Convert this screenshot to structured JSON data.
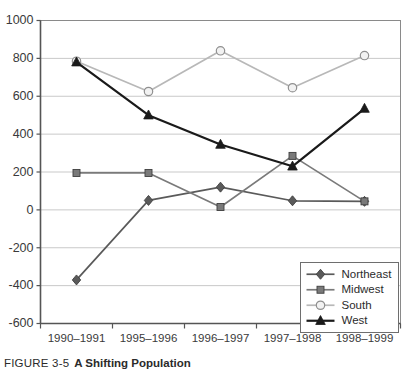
{
  "figure": {
    "caption_number": "FIGURE 3-5",
    "caption_title": "A Shifting Population"
  },
  "chart_data": {
    "type": "line",
    "title": "A Shifting Population",
    "xlabel": "",
    "ylabel": "",
    "categories": [
      "1990–1991",
      "1995–1996",
      "1996–1997",
      "1997–1998",
      "1998–1999"
    ],
    "ylim": [
      -600,
      1000
    ],
    "ytick_values": [
      1000,
      800,
      600,
      400,
      200,
      0,
      -200,
      -400,
      -600
    ],
    "ytick_labels": [
      "1000",
      "800",
      "600",
      "400",
      "200",
      "0",
      "-200",
      "-400",
      "-600"
    ],
    "grid": "horizontal",
    "legend_position": "bottom-right",
    "series": [
      {
        "name": "Northeast",
        "marker": "diamond",
        "color": "#5a5a5a",
        "values": [
          -370,
          50,
          120,
          48,
          45
        ]
      },
      {
        "name": "Midwest",
        "marker": "square",
        "color": "#7a7a7a",
        "values": [
          195,
          195,
          15,
          285,
          45
        ]
      },
      {
        "name": "South",
        "marker": "open-circle",
        "color": "#b8b8b8",
        "values": [
          785,
          625,
          840,
          645,
          815
        ]
      },
      {
        "name": "West",
        "marker": "triangle",
        "color": "#1a1a1a",
        "values": [
          780,
          500,
          345,
          230,
          535
        ]
      }
    ]
  }
}
